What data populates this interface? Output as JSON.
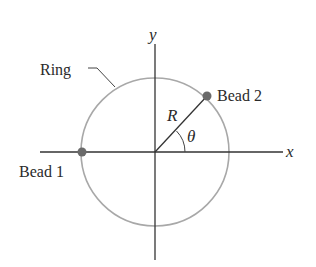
{
  "diagram": {
    "labels": {
      "y_axis": "y",
      "x_axis": "x",
      "ring": "Ring",
      "bead1": "Bead 1",
      "bead2": "Bead 2",
      "radius": "R",
      "angle": "θ"
    },
    "colors": {
      "axis": "#333333",
      "ring": "#a8a8a8",
      "bead": "#6a6a6a",
      "radius_line": "#333333",
      "text": "#2a2a2a"
    }
  }
}
